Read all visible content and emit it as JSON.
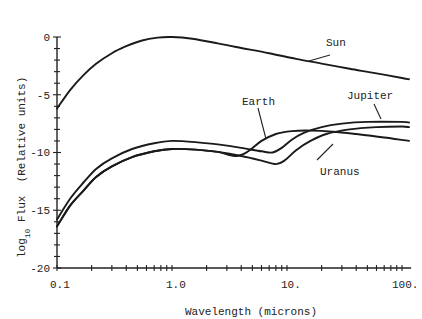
{
  "chart_data": {
    "type": "line",
    "title": "",
    "xlabel": "Wavelength (microns)",
    "ylabel_main": "log",
    "ylabel_sub": "10",
    "ylabel_rest": " Flux  (Relative units)",
    "xscale": "log",
    "xlim": [
      0.1,
      120
    ],
    "ylim": [
      -20,
      0
    ],
    "x_tick_labels": [
      "0.1",
      "1.0",
      "10.",
      "100."
    ],
    "x_tick_values": [
      0.1,
      1.0,
      10,
      100
    ],
    "y_tick_labels": [
      "0",
      "-5",
      "-10",
      "-15",
      "-20"
    ],
    "y_tick_values": [
      0,
      -5,
      -10,
      -15,
      -20
    ],
    "grid": false,
    "legend": "none (curves labeled directly)",
    "series": [
      {
        "name": "Sun",
        "x": [
          0.1,
          0.13,
          0.17,
          0.22,
          0.3,
          0.4,
          0.55,
          0.75,
          1.0,
          1.5,
          2.5,
          4,
          7,
          12,
          20,
          35,
          60,
          100,
          115
        ],
        "y": [
          -6.2,
          -4.6,
          -3.3,
          -2.3,
          -1.4,
          -0.8,
          -0.3,
          -0.05,
          0.0,
          -0.15,
          -0.55,
          -0.95,
          -1.4,
          -1.9,
          -2.3,
          -2.75,
          -3.15,
          -3.55,
          -3.65
        ],
        "label_anchor_x": 11
      },
      {
        "name": "Jupiter",
        "x": [
          0.1,
          0.13,
          0.17,
          0.22,
          0.3,
          0.45,
          0.7,
          1.0,
          1.6,
          2.5,
          4,
          6,
          7.5,
          9,
          11,
          14,
          20,
          30,
          50,
          100,
          115
        ],
        "y": [
          -15.8,
          -14.0,
          -12.6,
          -11.4,
          -10.5,
          -9.7,
          -9.2,
          -9.0,
          -9.1,
          -9.3,
          -9.6,
          -9.9,
          -10.0,
          -9.6,
          -8.9,
          -8.3,
          -7.8,
          -7.5,
          -7.35,
          -7.35,
          -7.4
        ],
        "label_anchor_x": 45
      },
      {
        "name": "Earth",
        "x": [
          0.1,
          0.13,
          0.17,
          0.22,
          0.3,
          0.45,
          0.7,
          1.0,
          1.6,
          2.5,
          3.6,
          4.6,
          6,
          8,
          11,
          16,
          25,
          40,
          70,
          115
        ],
        "y": [
          -16.4,
          -14.6,
          -13.3,
          -12.1,
          -11.2,
          -10.4,
          -9.9,
          -9.7,
          -9.75,
          -9.95,
          -10.3,
          -9.9,
          -9.0,
          -8.4,
          -8.15,
          -8.1,
          -8.2,
          -8.4,
          -8.7,
          -9.0
        ],
        "label_anchor_x": 6
      },
      {
        "name": "Uranus",
        "x": [
          0.1,
          0.13,
          0.17,
          0.22,
          0.3,
          0.45,
          0.7,
          1.0,
          1.6,
          2.5,
          4,
          6,
          8,
          9.5,
          12,
          16,
          22,
          35,
          60,
          100,
          115
        ],
        "y": [
          -16.4,
          -14.6,
          -13.3,
          -12.1,
          -11.2,
          -10.4,
          -9.9,
          -9.7,
          -9.75,
          -9.95,
          -10.3,
          -10.7,
          -11.0,
          -10.7,
          -9.8,
          -9.0,
          -8.4,
          -8.0,
          -7.8,
          -7.75,
          -7.8
        ],
        "label_anchor_x": 13
      }
    ]
  }
}
